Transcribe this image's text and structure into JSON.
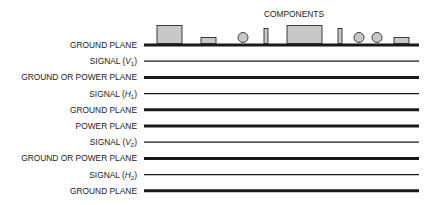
{
  "title": "COMPONENTS",
  "colors": {
    "line": "#1a1a1a",
    "component_fill": "#c8c8c8",
    "component_stroke": "#2a2a2a"
  },
  "layers": [
    {
      "label": "GROUND PLANE",
      "sub": "",
      "suffix": "",
      "type": "plane"
    },
    {
      "label": "SIGNAL (",
      "italic": "V",
      "sub": "1",
      "suffix": ")",
      "type": "signal"
    },
    {
      "label": "GROUND OR POWER PLANE",
      "sub": "",
      "suffix": "",
      "type": "plane"
    },
    {
      "label": "SIGNAL (",
      "italic": "H",
      "sub": "1",
      "suffix": ")",
      "type": "signal"
    },
    {
      "label": "GROUND PLANE",
      "sub": "",
      "suffix": "",
      "type": "plane"
    },
    {
      "label": "POWER PLANE",
      "sub": "",
      "suffix": "",
      "type": "plane"
    },
    {
      "label": "SIGNAL (",
      "italic": "V",
      "sub": "2",
      "suffix": ")",
      "type": "signal"
    },
    {
      "label": "GROUND OR POWER PLANE",
      "sub": "",
      "suffix": "",
      "type": "plane"
    },
    {
      "label": "SIGNAL (",
      "italic": "H",
      "sub": "2",
      "suffix": ")",
      "type": "signal"
    },
    {
      "label": "GROUND PLANE",
      "sub": "",
      "suffix": "",
      "type": "plane"
    }
  ],
  "components": [
    {
      "kind": "large-rect"
    },
    {
      "kind": "small-rect"
    },
    {
      "kind": "circle"
    },
    {
      "kind": "thin-rect"
    },
    {
      "kind": "large-rect"
    },
    {
      "kind": "thin-rect"
    },
    {
      "kind": "circle"
    },
    {
      "kind": "circle"
    },
    {
      "kind": "small-rect"
    }
  ]
}
